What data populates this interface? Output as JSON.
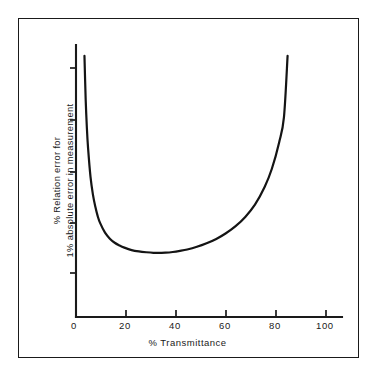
{
  "figure": {
    "background_color": "#ffffff",
    "ink_color": "#1a1a1a",
    "border_color": "#1a1a1a"
  },
  "chart_data": {
    "type": "line",
    "title": "",
    "subtitle": "",
    "xlabel": "% Transmittance",
    "ylabel_line1": "% Relation error for",
    "ylabel_line2": "1% absolute error in measurement",
    "xlim": [
      0,
      110
    ],
    "ylim": [
      0,
      100
    ],
    "xticks": [
      0,
      20,
      40,
      60,
      80,
      100
    ],
    "xticklabels": [
      "0",
      "20",
      "40",
      "60",
      "80",
      "100"
    ],
    "yticks": [
      20,
      40,
      60,
      80,
      100
    ],
    "yticklabels": [
      "",
      "",
      "",
      "",
      ""
    ],
    "grid": false,
    "legend": null,
    "annotations": [],
    "series": [
      {
        "name": "% Relative error for 1% absolute photometric error",
        "x": [
          3.5,
          4,
          4.5,
          5,
          6,
          7,
          8,
          9,
          10,
          12,
          14,
          16,
          18,
          20,
          23,
          26,
          29,
          32,
          35,
          37,
          40,
          43,
          46,
          50,
          54,
          58,
          62,
          66,
          70,
          74,
          78,
          81,
          84,
          86,
          87.5
        ],
        "y": [
          96,
          80,
          69.5,
          62,
          51.5,
          45,
          40.5,
          37,
          34.5,
          31,
          28.8,
          27.3,
          26.3,
          25.5,
          24.6,
          24.1,
          23.8,
          23.6,
          23.6,
          23.65,
          23.9,
          24.3,
          24.8,
          25.8,
          27.1,
          28.7,
          30.8,
          33.4,
          36.8,
          41.3,
          47.8,
          54.5,
          64.2,
          73.5,
          96
        ],
        "minimum_x": 37,
        "minimum_y": 23.6
      }
    ]
  },
  "xticks_px": [
    {
      "label": "0",
      "left": 71
    },
    {
      "label": "20",
      "left": 119
    },
    {
      "label": "40",
      "left": 169
    },
    {
      "label": "60",
      "left": 219
    },
    {
      "label": "80",
      "left": 269
    },
    {
      "label": "100",
      "left": 316
    }
  ]
}
